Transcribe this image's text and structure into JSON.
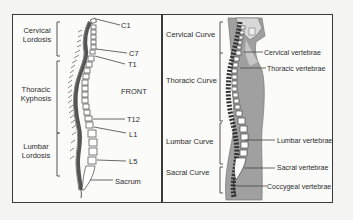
{
  "figure": {
    "left_panel": {
      "view_label": "FRONT",
      "curve_labels": [
        {
          "line1": "Cervical",
          "line2": "Lordosis"
        },
        {
          "line1": "Thoracic",
          "line2": "Kyphosis"
        },
        {
          "line1": "Lumbar",
          "line2": "Lordosis"
        }
      ],
      "vertebra_labels": [
        "C1",
        "C7",
        "T1",
        "T12",
        "L1",
        "L5",
        "Sacrum"
      ]
    },
    "right_panel": {
      "curve_labels": [
        "Cervical Curve",
        "Thoracic Curve",
        "Lumbar Curve",
        "Sacral Curve"
      ],
      "vertebra_labels": [
        "Cervical vertebrae",
        "Thoracic vertebrae",
        "Lumbar vertebrae",
        "Sacral vertebrae",
        "Coccygeal vertebrae"
      ]
    },
    "colors": {
      "frame": "#3a3a3a",
      "body_shade": "#9a9a9a",
      "bone": "#ffffff",
      "outline": "#333333"
    }
  }
}
